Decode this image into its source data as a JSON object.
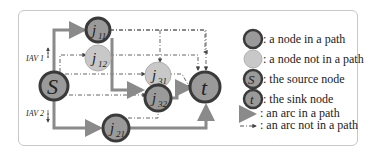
{
  "diagram": {
    "nodes": [
      {
        "id": "s",
        "label": "S",
        "sub": "",
        "type": "source"
      },
      {
        "id": "j11",
        "label": "j",
        "sub": "11",
        "type": "in-path"
      },
      {
        "id": "j12",
        "label": "j",
        "sub": "12",
        "type": "not-in-path"
      },
      {
        "id": "j31",
        "label": "j",
        "sub": "31",
        "type": "not-in-path"
      },
      {
        "id": "j32",
        "label": "j",
        "sub": "32",
        "type": "in-path"
      },
      {
        "id": "j21",
        "label": "j",
        "sub": "21",
        "type": "in-path"
      },
      {
        "id": "t",
        "label": "t",
        "sub": "",
        "type": "sink"
      }
    ],
    "side_labels": {
      "iav1": "IAV 1",
      "iav2": "IAV 2"
    },
    "colors": {
      "node_in": "#9a9a9a",
      "node_out": "#c8c8c8",
      "node_border": "#3a3a3a",
      "arc_in": "#8a8a8a",
      "arc_out": "#444444"
    }
  },
  "legend": {
    "items": [
      {
        "symbol": "node-in-path",
        "text": ": a node in a path"
      },
      {
        "symbol": "node-not-in-path",
        "text": ": a node not in a path"
      },
      {
        "symbol": "source-node",
        "glyph": "S",
        "text": ": the source node"
      },
      {
        "symbol": "sink-node",
        "glyph": "t",
        "text": ": the sink node"
      },
      {
        "symbol": "arc-in-path",
        "text": ": an arc in a path"
      },
      {
        "symbol": "arc-not-in-path",
        "text": ": an arc not in a path"
      }
    ]
  }
}
